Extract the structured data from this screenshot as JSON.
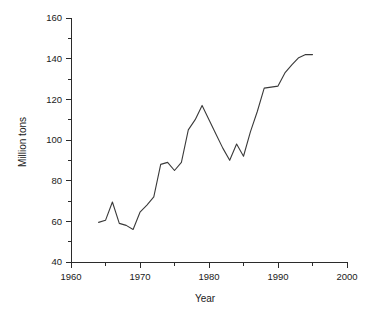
{
  "chart_data": {
    "type": "line",
    "title": "",
    "xlabel": "Year",
    "ylabel": "Million tons",
    "xlim": [
      1960,
      2000
    ],
    "ylim": [
      40,
      160
    ],
    "grid": false,
    "legend": null,
    "x_major_ticks": [
      1960,
      1970,
      1980,
      1990,
      2000
    ],
    "x_minor_ticks": [
      1965,
      1975,
      1985,
      1995
    ],
    "x_tick_labels": [
      "1960",
      "1970",
      "1980",
      "1990",
      "2000"
    ],
    "y_major_ticks": [
      40,
      60,
      80,
      100,
      120,
      140,
      160
    ],
    "y_minor_ticks": [
      50,
      70,
      90,
      110,
      130,
      150
    ],
    "y_tick_labels": [
      "40",
      "60",
      "80",
      "100",
      "120",
      "140",
      "160"
    ],
    "series": [
      {
        "name": "Production",
        "x": [
          1964,
          1965,
          1966,
          1967,
          1968,
          1969,
          1970,
          1971,
          1972,
          1973,
          1974,
          1975,
          1976,
          1977,
          1978,
          1979,
          1980,
          1981,
          1982,
          1983,
          1984,
          1985,
          1986,
          1987,
          1988,
          1989,
          1990,
          1991,
          1992,
          1993,
          1994,
          1995
        ],
        "values": [
          59.5,
          60.5,
          69.5,
          59.0,
          58.0,
          56.0,
          64.5,
          68.0,
          72.0,
          88.0,
          89.0,
          85.0,
          89.0,
          105.0,
          110.0,
          117.0,
          110.0,
          103.0,
          96.0,
          90.0,
          98.0,
          92.0,
          104.0,
          114.0,
          125.5,
          126.0,
          126.5,
          133.0,
          137.0,
          140.5,
          142.0,
          142.0
        ]
      }
    ]
  },
  "axes": {
    "y_label": "Million tons",
    "x_label": "Year"
  }
}
